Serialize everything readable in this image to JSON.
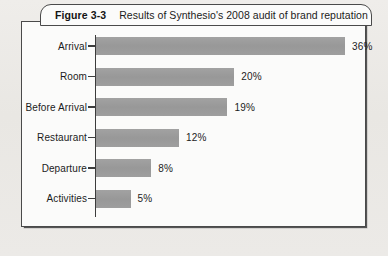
{
  "figure": {
    "number_label": "Figure 3-3",
    "caption": "Results of Synthesio's 2008 audit of brand reputation"
  },
  "colors": {
    "bar_fill": "#9b9b9b",
    "axis": "#3c3c3c",
    "border": "#4a4a4a",
    "panel_bg": "#fbfbfa",
    "page_bg": "#eceae6",
    "text": "#1c1c1c"
  },
  "chart_data": {
    "type": "bar",
    "orientation": "horizontal",
    "title": "Results of Synthesio's 2008 audit of brand reputation",
    "xlabel": "",
    "ylabel": "",
    "categories": [
      "Arrival",
      "Room",
      "Before Arrival",
      "Restaurant",
      "Departure",
      "Activities"
    ],
    "values": [
      36,
      20,
      19,
      12,
      8,
      5
    ],
    "value_labels": [
      "36%",
      "20%",
      "19%",
      "12%",
      "8%",
      "5%"
    ],
    "xlim": [
      0,
      36
    ],
    "grid": false,
    "legend": null,
    "units": "percent"
  }
}
